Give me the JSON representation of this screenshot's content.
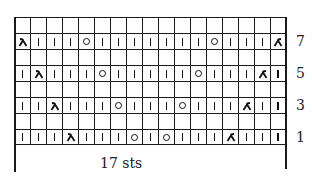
{
  "chart": {
    "columns": 17,
    "rows_top_to_bottom": [
      {
        "row": 8,
        "label": "",
        "stitches": [
          "e",
          "e",
          "e",
          "e",
          "e",
          "e",
          "e",
          "e",
          "e",
          "e",
          "e",
          "e",
          "e",
          "e",
          "e",
          "e",
          "e"
        ]
      },
      {
        "row": 7,
        "label": "7",
        "stitches": [
          "k2tog",
          "k",
          "k",
          "k",
          "yo",
          "k",
          "k",
          "k",
          "k",
          "k",
          "k",
          "k",
          "yo",
          "k",
          "k",
          "k",
          "ssk"
        ]
      },
      {
        "row": 6,
        "label": "",
        "stitches": [
          "e",
          "e",
          "e",
          "e",
          "e",
          "e",
          "e",
          "e",
          "e",
          "e",
          "e",
          "e",
          "e",
          "e",
          "e",
          "e",
          "e"
        ]
      },
      {
        "row": 5,
        "label": "5",
        "stitches": [
          "k",
          "k2tog",
          "k",
          "k",
          "k",
          "yo",
          "k",
          "k",
          "k",
          "k",
          "k",
          "yo",
          "k",
          "k",
          "k",
          "ssk",
          "k"
        ]
      },
      {
        "row": 4,
        "label": "",
        "stitches": [
          "e",
          "e",
          "e",
          "e",
          "e",
          "e",
          "e",
          "e",
          "e",
          "e",
          "e",
          "e",
          "e",
          "e",
          "e",
          "e",
          "e"
        ]
      },
      {
        "row": 3,
        "label": "3",
        "stitches": [
          "k",
          "k",
          "k2tog",
          "k",
          "k",
          "k",
          "yo",
          "k",
          "k",
          "k",
          "yo",
          "k",
          "k",
          "k",
          "ssk",
          "k",
          "k"
        ]
      },
      {
        "row": 2,
        "label": "",
        "stitches": [
          "e",
          "e",
          "e",
          "e",
          "e",
          "e",
          "e",
          "e",
          "e",
          "e",
          "e",
          "e",
          "e",
          "e",
          "e",
          "e",
          "e"
        ]
      },
      {
        "row": 1,
        "label": "1",
        "stitches": [
          "k",
          "k",
          "k",
          "k2tog",
          "k",
          "k",
          "k",
          "yo",
          "k",
          "yo",
          "k",
          "k",
          "k",
          "ssk",
          "k",
          "k",
          "k"
        ]
      }
    ],
    "legend_symbols": {
      "k": "knit (vertical bar)",
      "yo": "yarn over (circle)",
      "k2tog": "right-leaning decrease",
      "ssk": "left-leaning decrease",
      "e": "empty (wrong-side row)"
    },
    "width_label": "17 sts",
    "colors": {
      "grid": "#1a1a1a",
      "symbol": "#111111",
      "background": "#ffffff"
    }
  }
}
